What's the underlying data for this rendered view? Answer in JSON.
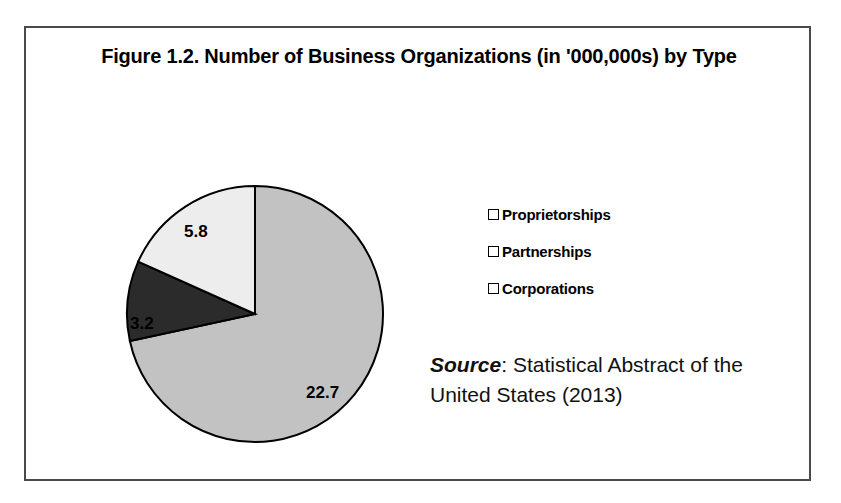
{
  "figure": {
    "title": "Figure 1.2. Number of Business Organizations (in '000,000s) by Type",
    "source_label": "Source",
    "source_separator": ": ",
    "source_text": "Statistical Abstract of the United States (2013)",
    "border_color": "#4a4a4a",
    "background_color": "#ffffff"
  },
  "legend": {
    "items": [
      {
        "label": "Proprietorships",
        "color": "#c2c2c2"
      },
      {
        "label": "Partnerships",
        "color": "#2b2b2b"
      },
      {
        "label": "Corporations",
        "color": "#ededed"
      }
    ]
  },
  "chart_data": {
    "type": "pie",
    "title": "Figure 1.2. Number of Business Organizations (in '000,000s) by Type",
    "xlabel": "",
    "ylabel": "",
    "unit": "millions",
    "total": 31.7,
    "start_angle_deg": 0,
    "direction": "clockwise",
    "legend_position": "right",
    "grid": false,
    "categories": [
      "Proprietorships",
      "Partnerships",
      "Corporations"
    ],
    "values": [
      22.7,
      3.2,
      5.8
    ],
    "labels": [
      "22.7",
      "3.2",
      "5.8"
    ],
    "colors": [
      "#c2c2c2",
      "#2b2b2b",
      "#ededed"
    ],
    "slice_stroke": "#000000",
    "annotations": [
      {
        "text": "22.7",
        "series": "Proprietorships"
      },
      {
        "text": "3.2",
        "series": "Partnerships"
      },
      {
        "text": "5.8",
        "series": "Corporations"
      }
    ]
  }
}
